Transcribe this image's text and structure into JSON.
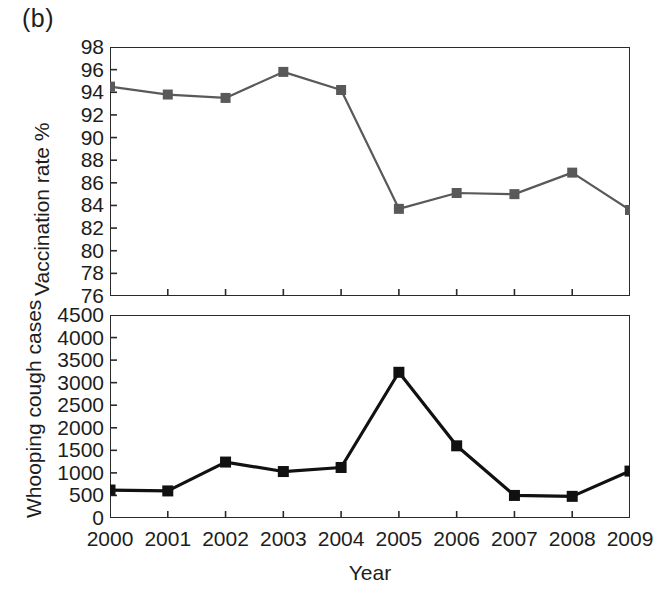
{
  "figure": {
    "panel_label": "(b)",
    "background": "#ffffff"
  },
  "chart_data": [
    {
      "type": "line",
      "id": "vaccination-rate",
      "title": "",
      "xlabel": "",
      "ylabel": "Vaccination rate %",
      "categories": [
        "2000",
        "2001",
        "2002",
        "2003",
        "2004",
        "2005",
        "2006",
        "2007",
        "2008",
        "2009"
      ],
      "x": [
        2000,
        2001,
        2002,
        2003,
        2004,
        2005,
        2006,
        2007,
        2008,
        2009
      ],
      "values": [
        94.5,
        93.8,
        93.5,
        95.8,
        94.2,
        83.7,
        85.1,
        85.0,
        86.9,
        83.6
      ],
      "ylim": [
        76,
        98
      ],
      "ytick_labels": [
        "98",
        "96",
        "94",
        "92",
        "90",
        "88",
        "86",
        "84",
        "82",
        "80",
        "78",
        "76"
      ],
      "yticks": [
        98,
        96,
        94,
        92,
        90,
        88,
        86,
        84,
        82,
        80,
        78,
        76
      ],
      "xtick_labels": [],
      "grid": false,
      "legend": "none",
      "series_color": "#595959",
      "marker": "square"
    },
    {
      "type": "line",
      "id": "whooping-cough-cases",
      "title": "",
      "xlabel": "Year",
      "ylabel": "Whooping cough cases",
      "categories": [
        "2000",
        "2001",
        "2002",
        "2003",
        "2004",
        "2005",
        "2006",
        "2007",
        "2008",
        "2009"
      ],
      "x": [
        2000,
        2001,
        2002,
        2003,
        2004,
        2005,
        2006,
        2007,
        2008,
        2009
      ],
      "values": [
        620,
        600,
        1240,
        1030,
        1120,
        3230,
        1600,
        500,
        480,
        1040
      ],
      "ylim": [
        0,
        4500
      ],
      "ytick_labels": [
        "4500",
        "4000",
        "3500",
        "3000",
        "2500",
        "2000",
        "1500",
        "1000",
        "500",
        "0"
      ],
      "yticks": [
        4500,
        4000,
        3500,
        3000,
        2500,
        2000,
        1500,
        1000,
        500,
        0
      ],
      "xtick_labels": [
        "2000",
        "2001",
        "2002",
        "2003",
        "2004",
        "2005",
        "2006",
        "2007",
        "2008",
        "2009"
      ],
      "grid": false,
      "legend": "none",
      "series_color": "#111111",
      "marker": "square"
    }
  ]
}
